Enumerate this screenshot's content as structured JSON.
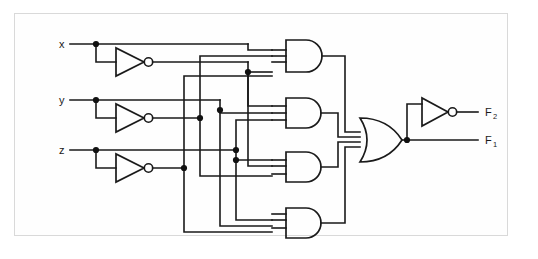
{
  "diagram": {
    "type": "logic-circuit-schematic",
    "background_color": "#ffffff",
    "wire_color": "#1a1a1a",
    "frame_color": "#d9d9d9"
  },
  "inputs": [
    {
      "id": "x",
      "label": "x",
      "y": 44
    },
    {
      "id": "y",
      "label": "y",
      "y": 100
    },
    {
      "id": "z",
      "label": "z",
      "y": 150
    }
  ],
  "outputs": [
    {
      "id": "F2",
      "label": "F",
      "subscript": "2",
      "y": 112
    },
    {
      "id": "F1",
      "label": "F",
      "subscript": "1",
      "y": 140
    }
  ],
  "gates": {
    "inverters": [
      {
        "id": "inv-x",
        "name": "not-gate-x",
        "input": "x",
        "output": "x-prime"
      },
      {
        "id": "inv-y",
        "name": "not-gate-y",
        "input": "y",
        "output": "y-prime"
      },
      {
        "id": "inv-z",
        "name": "not-gate-z",
        "input": "z",
        "output": "z-prime"
      },
      {
        "id": "inv-out",
        "name": "not-gate-output",
        "input": "F1",
        "output": "F2"
      }
    ],
    "and_gates": [
      {
        "id": "and1",
        "name": "and-gate-1",
        "inputs": [
          "x",
          "y-prime",
          "z-prime"
        ]
      },
      {
        "id": "and2",
        "name": "and-gate-2",
        "inputs": [
          "x-prime",
          "y",
          "z-prime"
        ]
      },
      {
        "id": "and3",
        "name": "and-gate-3",
        "inputs": [
          "x-prime",
          "y-prime",
          "z"
        ]
      },
      {
        "id": "and4",
        "name": "and-gate-4",
        "inputs": [
          "x",
          "y",
          "z"
        ]
      }
    ],
    "or_gates": [
      {
        "id": "or1",
        "name": "or-gate-sum",
        "inputs": [
          "and1",
          "and2",
          "and3",
          "and4"
        ],
        "output": "F1"
      }
    ]
  },
  "junction_count": 13
}
